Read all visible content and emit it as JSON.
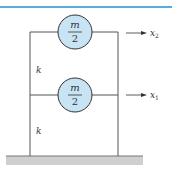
{
  "diagram": {
    "colors": {
      "accent_line": "#5aaed6",
      "mass_fill": "#c7e3f4",
      "mass_stroke": "#333333",
      "frame": "#555555",
      "ground": "#cccccc"
    },
    "masses": [
      {
        "id": "top",
        "numerator": "m",
        "denominator": "2",
        "displacement": "x",
        "subscript": "2"
      },
      {
        "id": "bottom",
        "numerator": "m",
        "denominator": "2",
        "displacement": "x",
        "subscript": "1"
      }
    ],
    "springs": [
      {
        "id": "upper",
        "label": "k"
      },
      {
        "id": "lower",
        "label": "k"
      }
    ]
  }
}
